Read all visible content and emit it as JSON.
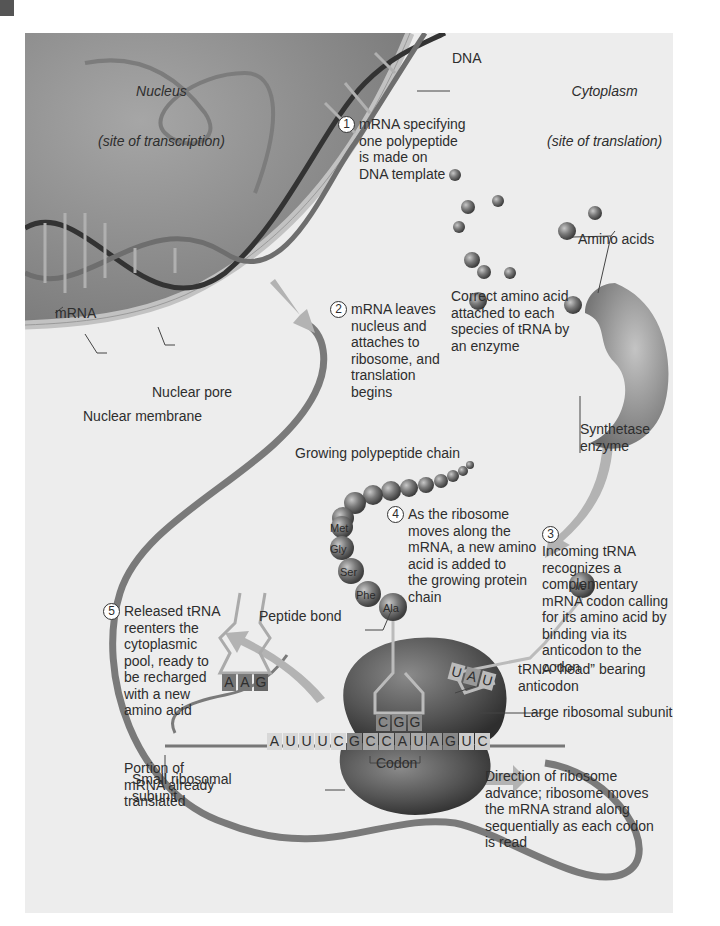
{
  "figure": {
    "title_regions": {
      "nucleus": {
        "title": "Nucleus",
        "subtitle": "(site of transcription)"
      },
      "cytoplasm": {
        "title": "Cytoplasm",
        "subtitle": "(site of translation)"
      }
    },
    "labels": {
      "dna": "DNA",
      "mrna": "mRNA",
      "nuclear_pore": "Nuclear pore",
      "nuclear_membrane": "Nuclear membrane",
      "amino_acids": "Amino acids",
      "correct_amino_acid": "Correct amino acid\nattached to each\nspecies of tRNA by\nan enzyme",
      "synthetase": "Synthetase\nenzyme",
      "growing_chain": "Growing polypeptide chain",
      "peptide_bond": "Peptide bond",
      "trna_head": "tRNA “head” bearing\nanticodon",
      "large_subunit": "Large ribosomal subunit",
      "small_subunit": "Small ribosomal\nsubunit",
      "codon": "Codon",
      "portion_translated": "Portion of\nmRNA already\ntranslated",
      "direction": "Direction of ribosome\nadvance; ribosome moves\nthe mRNA strand along\nsequentially as each codon\nis read"
    },
    "steps": [
      {
        "number": "1",
        "text": "mRNA specifying\none polypeptide\nis made on\nDNA template"
      },
      {
        "number": "2",
        "text": "mRNA leaves\nnucleus and\nattaches to\nribosome, and\ntranslation\nbegins"
      },
      {
        "number": "3",
        "text": "Incoming tRNA\nrecognizes a\ncomplementary\nmRNA codon calling\nfor its amino acid by\nbinding via its\nanticodon to the\ncodon"
      },
      {
        "number": "4",
        "text": "As the ribosome\nmoves along the\nmRNA, a new amino\nacid is added to\nthe growing protein\nchain"
      },
      {
        "number": "5",
        "text": "Released tRNA\nreenters the\ncytoplasmic\npool, ready to\nbe recharged\nwith a new\namino acid"
      }
    ],
    "amino_acid_chain": [
      "Met",
      "Gly",
      "Ser",
      "Phe",
      "Ala"
    ],
    "incoming_amino_acid": "Ile",
    "mrna_sequence": [
      "A",
      "U",
      "U",
      "U",
      "C",
      "G",
      "C",
      "C",
      "A",
      "U",
      "A",
      "G",
      "U",
      "C"
    ],
    "anticodon_bound": [
      "C",
      "G",
      "G"
    ],
    "anticodon_incoming": [
      "U",
      "A",
      "U"
    ],
    "anticodon_released": [
      "A",
      "A",
      "G"
    ],
    "colors": {
      "panel_bg": "#ededed",
      "nucleus": "#8c8c8c",
      "membrane": "#b8b8b8",
      "ribosome": "#5a5a5a",
      "arrow": "#b0b0b0"
    }
  }
}
